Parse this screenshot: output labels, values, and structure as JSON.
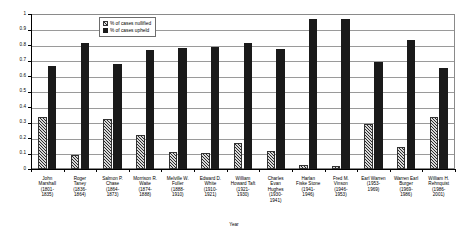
{
  "chart_data": {
    "type": "bar",
    "title": "",
    "xlabel": "Year",
    "ylabel": "Number",
    "ylim": [
      0,
      1
    ],
    "grid": true,
    "legend_position": "top-left-inside",
    "y_ticks": [
      "0",
      "0.1",
      "0.2",
      "0.3",
      "0.4",
      "0.5",
      "0.6",
      "0.7",
      "0.8",
      "0.9",
      "1"
    ],
    "categories": [
      "John Marshall (1801-1835)",
      "Roger Taney (1836-1864)",
      "Salmon P. Chase (1864-1873)",
      "Morrison R. Waite (1874-1888)",
      "Melville W. Fuller (1888-1910)",
      "Edward D. White (1910-1921)",
      "William Howard Taft (1921-1930)",
      "Charles Evan Hughes (1930-1941)",
      "Harlan Fiske Stone (1941-1946)",
      "Fred M. Vinson (1946-1953)",
      "Earl Warren (1953-1969)",
      "Warren Earl Burger (1969-1986)",
      "William H. Rehnquist (1986-2001)"
    ],
    "category_lines": [
      [
        "John",
        "Marshall",
        "(1801-",
        "1835)"
      ],
      [
        "Roger",
        "Taney",
        "(1836-",
        "1864)"
      ],
      [
        "Salmon P.",
        "Chase",
        "(1864-",
        "1873)"
      ],
      [
        "Morrison R.",
        "Waite",
        "(1874-",
        "1888)"
      ],
      [
        "Melville W.",
        "Fuller",
        "(1888-",
        "1910)"
      ],
      [
        "Edward D.",
        "White",
        "(1910-",
        "1921)"
      ],
      [
        "William",
        "Howard Taft",
        "(1921-",
        "1930)"
      ],
      [
        "Charles",
        "Evan",
        "Hughes",
        "(1930-",
        "1941)"
      ],
      [
        "Harlan",
        "Fiske Stone",
        "(1941-",
        "1946)"
      ],
      [
        "Fred M.",
        "Vinson",
        "(1946-",
        "1953)"
      ],
      [
        "Earl Warren",
        "(1953-",
        "1969)"
      ],
      [
        "Warren Earl",
        "Burger",
        "(1969-",
        "1986)"
      ],
      [
        "William H.",
        "Rehnquist",
        "(1986-",
        "2001)"
      ]
    ],
    "series": [
      {
        "name": "% of cases nullified",
        "color": "#d8d8d8",
        "pattern": "diagonal-hatch",
        "values": [
          0.335,
          0.09,
          0.32,
          0.22,
          0.11,
          0.105,
          0.17,
          0.115,
          0.025,
          0.02,
          0.29,
          0.145,
          0.335
        ]
      },
      {
        "name": "% of cases upheld",
        "color": "#1a1a1a",
        "pattern": "solid",
        "values": [
          0.665,
          0.81,
          0.675,
          0.77,
          0.78,
          0.785,
          0.815,
          0.775,
          0.965,
          0.965,
          0.69,
          0.835,
          0.65
        ]
      }
    ]
  }
}
